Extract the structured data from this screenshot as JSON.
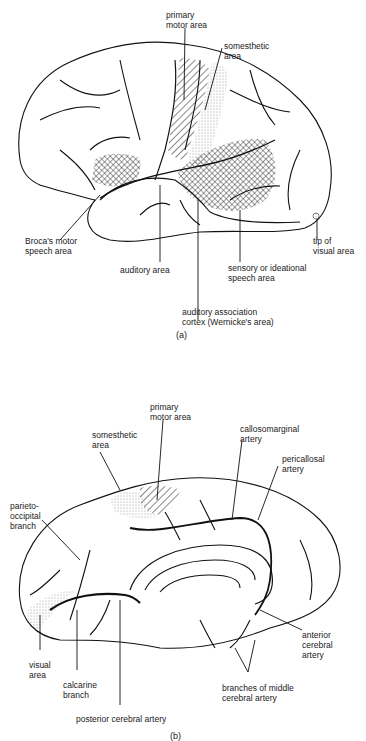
{
  "figure_a": {
    "caption": "(a)",
    "view": "lateral surface of left cerebral hemisphere",
    "labels": {
      "primary_motor_area": "primary\nmotor area",
      "somesthetic_area": "somesthetic\narea",
      "brocas_area": "Broca's motor\nspeech area",
      "auditory_area": "auditory area",
      "sensory_speech_area": "sensory or ideational\nspeech area",
      "wernickes_area": "auditory association\ncortex (Wernicke's area)",
      "tip_visual_area": "tip of\nvisual area"
    }
  },
  "figure_b": {
    "caption": "(b)",
    "view": "medial surface of cerebral hemisphere",
    "labels": {
      "primary_motor_area": "primary\nmotor area",
      "somesthetic_area": "somesthetic\narea",
      "callosomarginal_artery": "callosomarginal\nartery",
      "pericallosal_artery": "pericallosal\nartery",
      "parieto_occipital_branch": "parieto-\noccipital\nbranch",
      "visual_area": "visual\narea",
      "calcarine_branch": "calcarine\nbranch",
      "posterior_cerebral_artery": "posterior cerebral artery",
      "anterior_cerebral_artery": "anterior\ncerebral\nartery",
      "branches_middle_cerebral_artery": "branches of middle\ncerebral artery"
    }
  },
  "colors": {
    "ink": "#111111",
    "background": "#ffffff"
  }
}
